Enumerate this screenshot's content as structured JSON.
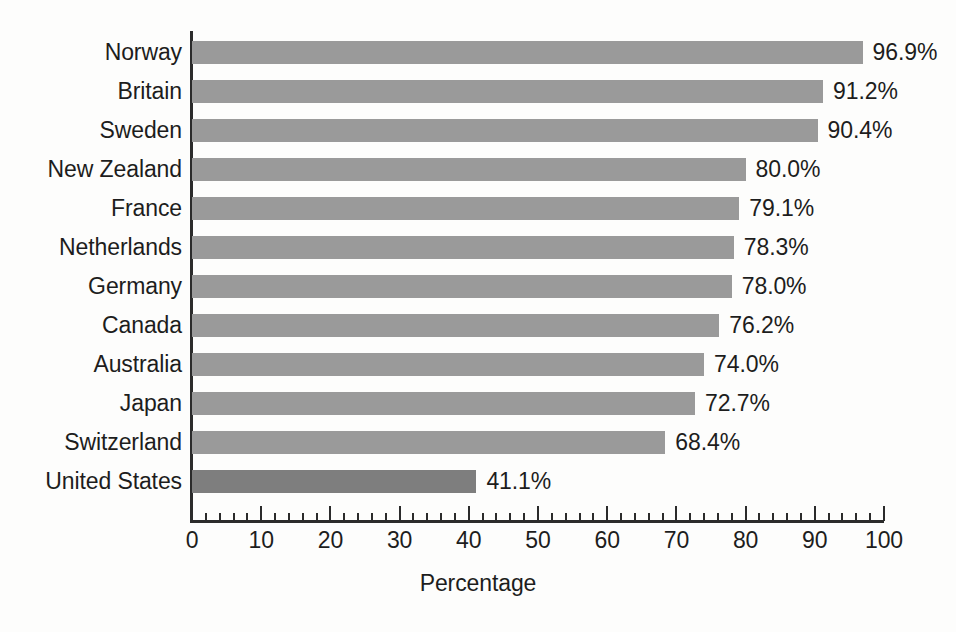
{
  "chart_data": {
    "type": "bar",
    "orientation": "horizontal",
    "title": "",
    "xlabel": "Percentage",
    "ylabel": "",
    "xlim": [
      0,
      100
    ],
    "grid": false,
    "legend": null,
    "categories": [
      "Norway",
      "Britain",
      "Sweden",
      "New Zealand",
      "France",
      "Netherlands",
      "Germany",
      "Canada",
      "Australia",
      "Japan",
      "Switzerland",
      "United States"
    ],
    "values": [
      96.9,
      91.2,
      90.4,
      80.0,
      79.1,
      78.3,
      78.0,
      76.2,
      74.0,
      72.7,
      68.4,
      41.1
    ],
    "data_labels": [
      "96.9%",
      "91.2%",
      "90.4%",
      "80.0%",
      "79.1%",
      "78.3%",
      "78.0%",
      "76.2%",
      "74.0%",
      "72.7%",
      "68.4%",
      "41.1%"
    ],
    "highlighted_category": "United States",
    "bar_color": "#9a9a9a",
    "highlight_color": "#7e7e7e",
    "axis_color": "#2b2b2b",
    "background_color": "#fdfdfc",
    "xticks": [
      0,
      10,
      20,
      30,
      40,
      50,
      60,
      70,
      80,
      90,
      100
    ],
    "xtick_labels": [
      "0",
      "10",
      "20",
      "30",
      "40",
      "50",
      "60",
      "70",
      "80",
      "90",
      "100"
    ],
    "minor_tick_interval": 2
  }
}
